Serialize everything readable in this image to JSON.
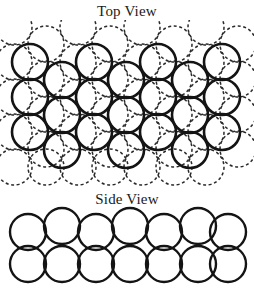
{
  "figure": {
    "kind": "crystal-packing-diagram",
    "background_color": "#ffffff",
    "width": 254,
    "height": 293
  },
  "top_view": {
    "title": "Top View",
    "solid_layer": {
      "label": "top layer spheres",
      "stroke_color": "#141414",
      "stroke_style": "solid",
      "radius": 18,
      "centers": [
        [
          30,
          62
        ],
        [
          30,
          97
        ],
        [
          30,
          132
        ],
        [
          62,
          80
        ],
        [
          62,
          115
        ],
        [
          62,
          150
        ],
        [
          94,
          62
        ],
        [
          94,
          97
        ],
        [
          94,
          132
        ],
        [
          126,
          80
        ],
        [
          126,
          115
        ],
        [
          126,
          150
        ],
        [
          158,
          62
        ],
        [
          158,
          97
        ],
        [
          158,
          132
        ],
        [
          190,
          80
        ],
        [
          190,
          115
        ],
        [
          190,
          150
        ],
        [
          222,
          62
        ],
        [
          222,
          97
        ],
        [
          222,
          132
        ]
      ]
    },
    "dashed_layer": {
      "label": "lower layer spheres",
      "stroke_color": "#2a2a2a",
      "stroke_style": "dashed",
      "radius": 18,
      "centers": [
        [
          46,
          44
        ],
        [
          46,
          79
        ],
        [
          46,
          114
        ],
        [
          46,
          149
        ],
        [
          46,
          167
        ],
        [
          78,
          27
        ],
        [
          78,
          62
        ],
        [
          78,
          97
        ],
        [
          78,
          132
        ],
        [
          78,
          167
        ],
        [
          110,
          44
        ],
        [
          110,
          79
        ],
        [
          110,
          114
        ],
        [
          110,
          149
        ],
        [
          110,
          167
        ],
        [
          142,
          27
        ],
        [
          142,
          62
        ],
        [
          142,
          97
        ],
        [
          142,
          132
        ],
        [
          142,
          167
        ],
        [
          174,
          44
        ],
        [
          174,
          79
        ],
        [
          174,
          114
        ],
        [
          174,
          149
        ],
        [
          174,
          167
        ],
        [
          206,
          27
        ],
        [
          206,
          62
        ],
        [
          206,
          97
        ],
        [
          206,
          132
        ],
        [
          206,
          167
        ],
        [
          14,
          27
        ],
        [
          14,
          62
        ],
        [
          14,
          97
        ],
        [
          14,
          132
        ],
        [
          14,
          167
        ],
        [
          238,
          44
        ],
        [
          238,
          79
        ],
        [
          238,
          114
        ],
        [
          238,
          149
        ]
      ]
    }
  },
  "side_view": {
    "title": "Side View",
    "stroke_color": "#141414",
    "stroke_style": "solid",
    "radius": 18,
    "upper_row_centers": [
      [
        28,
        232
      ],
      [
        62,
        226
      ],
      [
        96,
        232
      ],
      [
        130,
        226
      ],
      [
        164,
        232
      ],
      [
        198,
        226
      ],
      [
        228,
        232
      ]
    ],
    "lower_row_centers": [
      [
        28,
        264
      ],
      [
        62,
        264
      ],
      [
        96,
        264
      ],
      [
        130,
        264
      ],
      [
        164,
        264
      ],
      [
        198,
        264
      ],
      [
        228,
        264
      ]
    ]
  }
}
